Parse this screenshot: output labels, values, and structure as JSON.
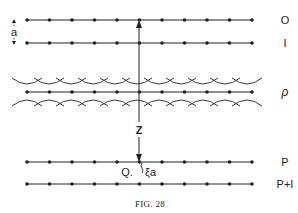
{
  "figure": {
    "caption": "Fig. 28",
    "caption_display": "FIG. 28"
  },
  "planes": [
    {
      "id": "plane-0",
      "label": "O",
      "dots": 11
    },
    {
      "id": "plane-1",
      "label": "I",
      "dots": 11
    },
    {
      "id": "plane-rho",
      "label": "ρ",
      "dots": 11,
      "with_waves": true
    },
    {
      "id": "plane-P",
      "label": "P",
      "dots": 11
    },
    {
      "id": "plane-P1",
      "label": "P+I",
      "dots": 11
    }
  ],
  "annotations": {
    "spacing_label": "a",
    "axis_label": "Z",
    "point_label": "Q.",
    "offset_label": "ξa"
  },
  "colors": {
    "ink": "#222222",
    "background": "#ffffff"
  }
}
